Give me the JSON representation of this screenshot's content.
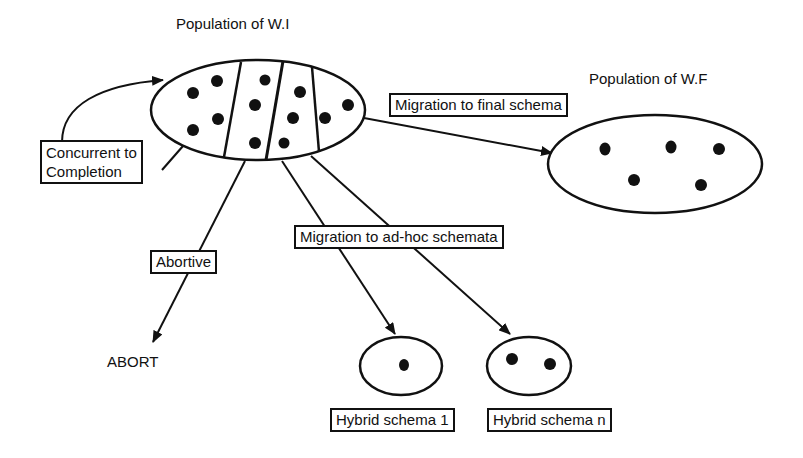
{
  "diagram": {
    "title_wi": "Population of W.I",
    "title_wf": "Population of W.F",
    "labels": {
      "concurrent_line1": "Concurrent to",
      "concurrent_line2": "Completion",
      "migration_final": "Migration to final schema",
      "migration_adhoc": "Migration to ad-hoc schemata",
      "abortive": "Abortive",
      "abort": "ABORT",
      "hybrid_1": "Hybrid schema 1",
      "hybrid_n": "Hybrid schema n"
    },
    "nodes": [
      {
        "id": "wi",
        "label": "Population of W.I",
        "partitions": 4,
        "dots": 12
      },
      {
        "id": "wf",
        "label": "Population of W.F",
        "dots": 5
      },
      {
        "id": "hybrid1",
        "label": "Hybrid schema 1",
        "dots": 1
      },
      {
        "id": "hybridn",
        "label": "Hybrid schema n",
        "dots": 2
      },
      {
        "id": "abort",
        "label": "ABORT"
      }
    ],
    "edges": [
      {
        "from": "wi",
        "to": "wi",
        "label": "Concurrent to Completion"
      },
      {
        "from": "wi",
        "to": "wf",
        "label": "Migration to final schema"
      },
      {
        "from": "wi",
        "to": "abort",
        "label": "Abortive"
      },
      {
        "from": "wi",
        "to": "hybrid1",
        "label": "Migration to ad-hoc schemata"
      },
      {
        "from": "wi",
        "to": "hybridn",
        "label": "Migration to ad-hoc schemata"
      }
    ],
    "colors": {
      "line": "#111111",
      "background": "#ffffff"
    }
  }
}
